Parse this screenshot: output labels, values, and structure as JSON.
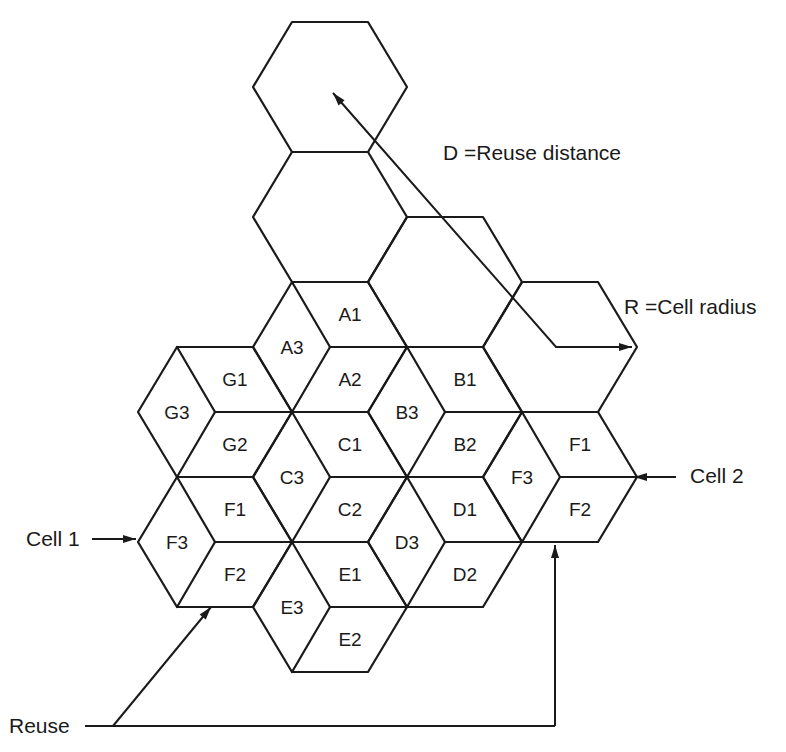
{
  "figure": {
    "hex_geometry": {
      "half_width": 77,
      "quarter_width": 38,
      "half_height": 65
    },
    "stroke_color": "#1a1a1a",
    "background": "#ffffff"
  },
  "plain_hexes": [
    {
      "id": "hex-top",
      "center": [
        330,
        87
      ]
    },
    {
      "id": "hex-second",
      "center": [
        330,
        217
      ]
    },
    {
      "id": "hex-third",
      "center": [
        445,
        282
      ]
    },
    {
      "id": "hex-radius",
      "center": [
        560,
        347
      ]
    }
  ],
  "clusters": [
    {
      "id": "A",
      "center": [
        330,
        347
      ],
      "labels": [
        "A1",
        "A2",
        "A3"
      ]
    },
    {
      "id": "B",
      "center": [
        445,
        412
      ],
      "labels": [
        "B1",
        "B2",
        "B3"
      ]
    },
    {
      "id": "G",
      "center": [
        215,
        412
      ],
      "labels": [
        "G1",
        "G2",
        "G3"
      ]
    },
    {
      "id": "C",
      "center": [
        330,
        477
      ],
      "labels": [
        "C1",
        "C2",
        "C3"
      ]
    },
    {
      "id": "D",
      "center": [
        445,
        542
      ],
      "labels": [
        "D1",
        "D2",
        "D3"
      ]
    },
    {
      "id": "F-left",
      "center": [
        215,
        542
      ],
      "labels": [
        "F1",
        "F2",
        "F3"
      ]
    },
    {
      "id": "E",
      "center": [
        330,
        607
      ],
      "labels": [
        "E1",
        "E2",
        "E3"
      ]
    },
    {
      "id": "F-right",
      "center": [
        560,
        477
      ],
      "labels": [
        "F1",
        "F2",
        "F3"
      ]
    }
  ],
  "annotations": {
    "reuse_distance": {
      "text": "D =Reuse distance",
      "x": 443,
      "y": 160
    },
    "cell_radius": {
      "text": "R =Cell radius",
      "x": 624,
      "y": 314
    },
    "cell1": {
      "text": "Cell 1",
      "x": 26,
      "y": 546
    },
    "cell2": {
      "text": "Cell 2",
      "x": 690,
      "y": 483
    },
    "reuse": {
      "text": "Reuse",
      "x": 9,
      "y": 733
    }
  },
  "arrows": {
    "distance_line": [
      [
        632,
        347
      ],
      [
        556,
        347
      ],
      [
        333,
        93
      ]
    ],
    "cell1_arrow": [
      [
        92,
        539
      ],
      [
        136,
        539
      ]
    ],
    "cell2_arrow": [
      [
        676,
        477
      ],
      [
        634,
        477
      ]
    ],
    "reuse_line": [
      [
        85,
        726
      ],
      [
        555,
        726
      ]
    ],
    "reuse_to_left": [
      [
        113,
        726
      ],
      [
        211,
        607
      ]
    ],
    "reuse_to_right": [
      [
        555,
        726
      ],
      [
        555,
        545
      ]
    ]
  }
}
